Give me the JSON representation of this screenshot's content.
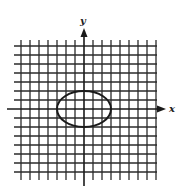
{
  "figure": {
    "type": "coordinate-plane-with-ellipse",
    "x_axis_label": "x",
    "y_axis_label": "y",
    "grid": {
      "units_left": 7,
      "units_right": 8,
      "units_up": 7,
      "units_down": 7,
      "unit_px": 9
    },
    "ellipse": {
      "center": [
        0,
        0
      ],
      "semi_axis_x": 3,
      "semi_axis_y": 2,
      "equation": "x^2/9 + y^2/4 = 1"
    },
    "colors": {
      "grid": "#2a2a2a",
      "axes": "#1a1a1a",
      "ellipse": "#1a1a1a",
      "background": "#ffffff"
    }
  }
}
